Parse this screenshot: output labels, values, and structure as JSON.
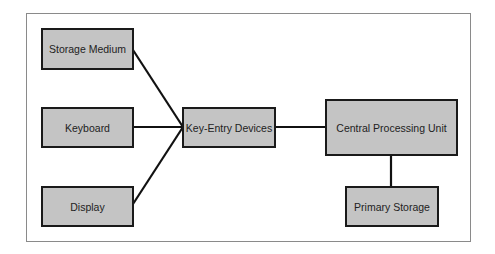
{
  "diagram": {
    "nodes": [
      {
        "id": "storage-medium",
        "label": "Storage Medium"
      },
      {
        "id": "keyboard",
        "label": "Keyboard"
      },
      {
        "id": "display",
        "label": "Display"
      },
      {
        "id": "key-entry-devices",
        "label": "Key-Entry Devices"
      },
      {
        "id": "cpu",
        "label": "Central Processing Unit"
      },
      {
        "id": "primary-storage",
        "label": "Primary Storage"
      }
    ],
    "edges": [
      {
        "from": "storage-medium",
        "to": "key-entry-devices"
      },
      {
        "from": "keyboard",
        "to": "key-entry-devices"
      },
      {
        "from": "display",
        "to": "key-entry-devices"
      },
      {
        "from": "key-entry-devices",
        "to": "cpu"
      },
      {
        "from": "cpu",
        "to": "primary-storage"
      }
    ],
    "colors": {
      "box_fill": "#c4c4c4",
      "box_border": "#1a1a1a",
      "line": "#111111",
      "frame": "#8a8a8a"
    }
  }
}
